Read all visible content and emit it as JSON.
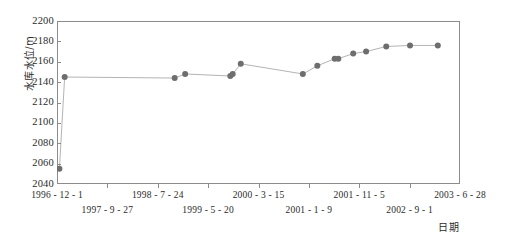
{
  "chart_data": {
    "type": "line",
    "title": "",
    "subtitle": "",
    "xlabel": "日期",
    "ylabel": "水库水位/m",
    "ylim": [
      2040,
      2200
    ],
    "yticks": [
      2040,
      2060,
      2080,
      2100,
      2120,
      2140,
      2160,
      2180,
      2200
    ],
    "xticklabels": [
      "1996 - 12 - 1",
      "1997 - 9 - 27",
      "1998 - 7 - 24",
      "1999 - 5 - 20",
      "2000 - 3 - 15",
      "2001 - 1 - 9",
      "2001 - 11 - 5",
      "2002 - 9 - 1",
      "2003 - 6 - 28"
    ],
    "grid": false,
    "legend": null,
    "marker": "circle",
    "marker_color": "#6e6e6e",
    "line_color": "#b4b4b4",
    "x": [
      "1996-12-1",
      "1997-1-15",
      "1999-2-10",
      "1999-3-20",
      "1999-10-28",
      "1999-11-20",
      "2000-1-5",
      "2000-4-2",
      "2000-12-20",
      "2001-2-14",
      "2001-4-2",
      "2001-6-10",
      "2001-8-20",
      "2002-1-5",
      "2002-4-20",
      "2002-10-10"
    ],
    "values": [
      2055,
      2145,
      2144,
      2148,
      2146,
      2148,
      2158,
      2148,
      2156,
      2163,
      2163,
      2168,
      2170,
      2175,
      2176,
      2176
    ],
    "points_px": [
      {
        "x": 0.6,
        "y": 2055
      },
      {
        "x": 1.9,
        "y": 2145
      },
      {
        "x": 29.2,
        "y": 2144
      },
      {
        "x": 31.8,
        "y": 2148
      },
      {
        "x": 43.0,
        "y": 2146
      },
      {
        "x": 43.6,
        "y": 2148
      },
      {
        "x": 45.6,
        "y": 2158
      },
      {
        "x": 61.0,
        "y": 2148
      },
      {
        "x": 64.6,
        "y": 2156
      },
      {
        "x": 68.9,
        "y": 2163
      },
      {
        "x": 69.8,
        "y": 2163
      },
      {
        "x": 73.5,
        "y": 2168
      },
      {
        "x": 76.7,
        "y": 2170
      },
      {
        "x": 81.7,
        "y": 2175
      },
      {
        "x": 87.6,
        "y": 2176
      },
      {
        "x": 94.5,
        "y": 2176
      }
    ]
  }
}
